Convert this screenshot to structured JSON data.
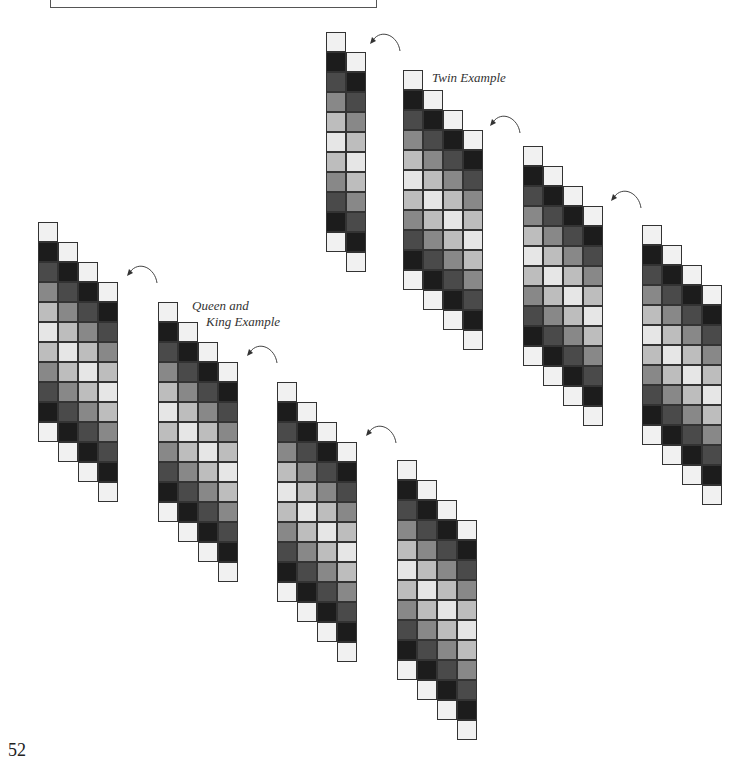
{
  "page": {
    "number": "52",
    "labels": {
      "twin": "Twin Example",
      "queen_king_line1": "Queen and",
      "queen_king_line2": "King Example"
    }
  },
  "shades": {
    "W": "#f1f1f1",
    "K": "#1c1c1c",
    "D": "#4a4a4a",
    "M": "#888888",
    "L": "#bdbdbd",
    "V": "#e6e6e6"
  },
  "column_sequence": [
    "W",
    "K",
    "D",
    "M",
    "L",
    "V",
    "L",
    "M",
    "D",
    "K",
    "W"
  ],
  "strips": [
    {
      "id": "strip-1",
      "x": 326,
      "y": 32,
      "cols": 2,
      "arrow": {
        "x": 368,
        "y": 30
      }
    },
    {
      "id": "strip-twin",
      "x": 403,
      "y": 70,
      "cols": 4,
      "label": "twin",
      "arrow": {
        "x": 488,
        "y": 112
      }
    },
    {
      "id": "strip-3",
      "x": 523,
      "y": 146,
      "cols": 4,
      "arrow": {
        "x": 609,
        "y": 187
      }
    },
    {
      "id": "strip-4",
      "x": 642,
      "y": 225,
      "cols": 4
    },
    {
      "id": "strip-5",
      "x": 38,
      "y": 222,
      "cols": 4,
      "arrow": {
        "x": 125,
        "y": 262
      }
    },
    {
      "id": "strip-queen-king",
      "x": 158,
      "y": 302,
      "cols": 4,
      "label": "queen_king",
      "arrow": {
        "x": 245,
        "y": 342
      }
    },
    {
      "id": "strip-7",
      "x": 277,
      "y": 382,
      "cols": 4,
      "arrow": {
        "x": 364,
        "y": 422
      }
    },
    {
      "id": "strip-8",
      "x": 397,
      "y": 460,
      "cols": 4
    }
  ]
}
